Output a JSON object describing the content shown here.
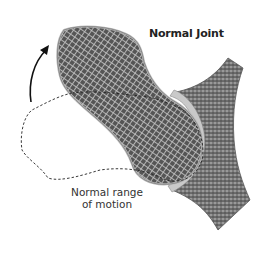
{
  "diagram": {
    "title": "Normal Joint",
    "caption_line1": "Normal range",
    "caption_line2": "of motion",
    "parts": [
      {
        "name": "femur",
        "description": "thigh bone with trabecular texture, head seated in socket"
      },
      {
        "name": "pelvis",
        "description": "hip bone with acetabulum socket"
      },
      {
        "name": "cartilage",
        "description": "light gray smooth layer lining the joint"
      },
      {
        "name": "range-of-motion-outline",
        "description": "dashed outline showing femur's alternate position"
      },
      {
        "name": "motion-arrow",
        "description": "curved arrow indicating upward rotation"
      }
    ],
    "colors": {
      "bone_dark": "#4a4a4a",
      "bone_mid": "#8a8a8a",
      "cartilage": "#c8c8c8",
      "outline": "#222222",
      "background": "#ffffff"
    }
  }
}
